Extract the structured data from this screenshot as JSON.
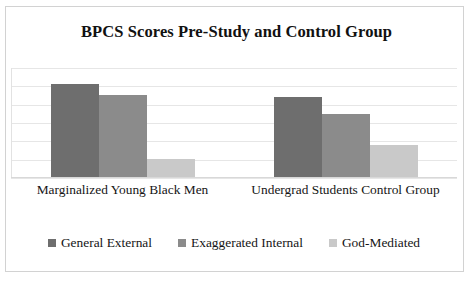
{
  "chart_data": {
    "type": "bar",
    "title": "BPCS Scores Pre-Study and Control Group",
    "xlabel": "",
    "ylabel": "",
    "categories": [
      "Marginalized Young Black Men",
      "Undergrad Students Control Group"
    ],
    "series": [
      {
        "name": "General External",
        "color": "#6e6e6e",
        "values": [
          5.1,
          4.35
        ]
      },
      {
        "name": "Exaggerated Internal",
        "color": "#8b8b8b",
        "values": [
          4.5,
          3.45
        ]
      },
      {
        "name": "God-Mediated",
        "color": "#c9c9c9",
        "values": [
          1.0,
          1.75
        ]
      }
    ],
    "ylim": [
      0,
      6
    ],
    "y_gridline_values": [
      6,
      5,
      4,
      3,
      2,
      1,
      0
    ],
    "grid": true,
    "y_axis_labels_visible": false,
    "legend_position": "bottom"
  },
  "legend": {
    "items": [
      {
        "label": "General External",
        "color": "#6e6e6e"
      },
      {
        "label": "Exaggerated Internal",
        "color": "#8b8b8b"
      },
      {
        "label": "God-Mediated",
        "color": "#c9c9c9"
      }
    ]
  },
  "axis": {
    "category_labels": [
      "Marginalized Young Black Men",
      "Undergrad Students Control Group"
    ]
  }
}
